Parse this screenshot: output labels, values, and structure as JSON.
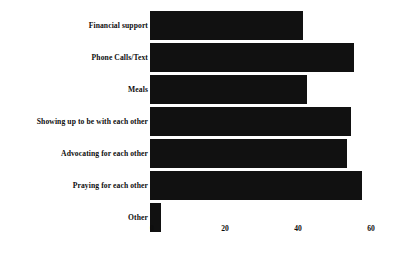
{
  "chart_data": {
    "type": "bar",
    "orientation": "horizontal",
    "title": "",
    "xlabel": "",
    "ylabel": "",
    "xlim": [
      0,
      60
    ],
    "xticks": [
      0,
      20,
      40,
      60
    ],
    "grid": false,
    "legend": false,
    "bar_color": "#111111",
    "background_color": "#ffffff",
    "categories": [
      "Financial support",
      "Phone Calls/Text",
      "Meals",
      "Showing up to be with each other",
      "Advocating for each other",
      "Praying for each other",
      "Other"
    ],
    "values": [
      42,
      56,
      43,
      55,
      54,
      58,
      3
    ]
  }
}
